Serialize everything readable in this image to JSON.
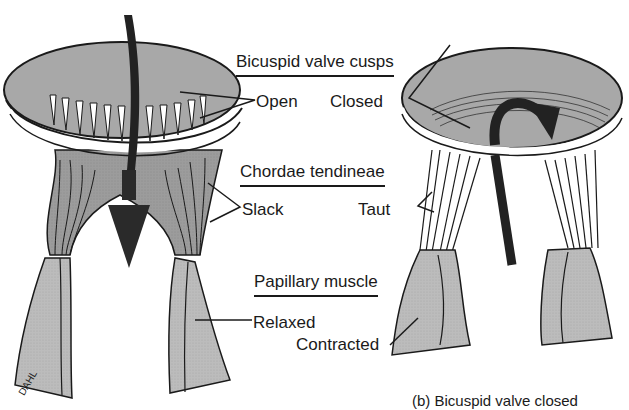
{
  "figure": {
    "headers": {
      "cusps": "Bicuspid valve cusps",
      "chordae": "Chordae tendineae",
      "papillary": "Papillary muscle"
    },
    "left_panel": {
      "state_cusps": "Open",
      "state_chordae": "Slack",
      "state_papillary": "Relaxed"
    },
    "right_panel": {
      "state_cusps": "Closed",
      "state_chordae": "Taut",
      "state_papillary": "Contracted"
    },
    "signature": "DAHL",
    "caption_partial": "(b) Bicuspid valve closed"
  },
  "colors": {
    "tissue_gray": "#9a9a9a",
    "muscle_gray": "#bdbdbd",
    "ink": "#1a1a1a",
    "arrow": "#2a2a2a",
    "background": "#ffffff"
  }
}
